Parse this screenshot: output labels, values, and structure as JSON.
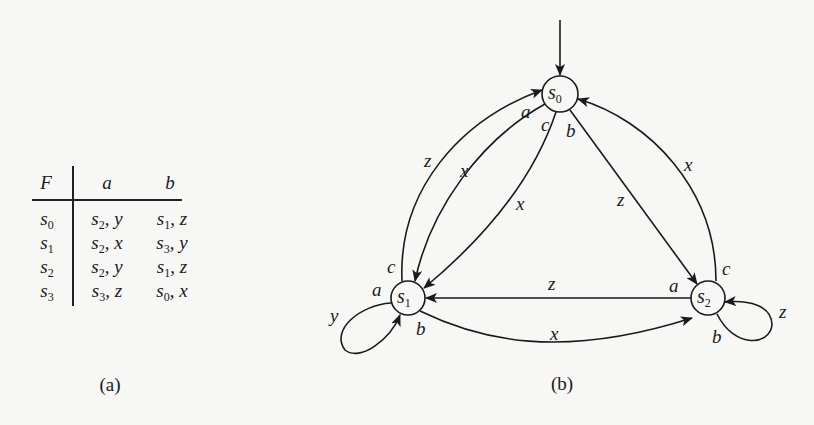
{
  "table": {
    "header": {
      "state": "F",
      "col_a": "a",
      "col_b": "b"
    },
    "rows": [
      {
        "state": "s0",
        "a_next": "s2",
        "a_out": "y",
        "b_next": "s1",
        "b_out": "z"
      },
      {
        "state": "s1",
        "a_next": "s2",
        "a_out": "x",
        "b_next": "s3",
        "b_out": "y"
      },
      {
        "state": "s2",
        "a_next": "s2",
        "a_out": "y",
        "b_next": "s1",
        "b_out": "z"
      },
      {
        "state": "s3",
        "a_next": "s3",
        "a_out": "z",
        "b_next": "s0",
        "b_out": "x"
      }
    ],
    "caption": "(a)"
  },
  "graph": {
    "caption": "(b)",
    "nodes": [
      {
        "id": "s0",
        "label": "s",
        "sub": "0",
        "initial": true
      },
      {
        "id": "s1",
        "label": "s",
        "sub": "1"
      },
      {
        "id": "s2",
        "label": "s",
        "sub": "2"
      }
    ],
    "edges": [
      {
        "from": "s1",
        "to": "s0",
        "input": "c",
        "output": "z"
      },
      {
        "from": "s0",
        "to": "s1",
        "input": "a",
        "output": "x"
      },
      {
        "from": "s0",
        "to": "s1",
        "input": "c",
        "output": "x"
      },
      {
        "from": "s0",
        "to": "s2",
        "input": "b",
        "output": "z"
      },
      {
        "from": "s2",
        "to": "s0",
        "input": "c",
        "output": "x"
      },
      {
        "from": "s2",
        "to": "s1",
        "input": "a",
        "output": "z"
      },
      {
        "from": "s1",
        "to": "s2",
        "input": "b",
        "output": "x"
      },
      {
        "from": "s1",
        "to": "s1",
        "input": "a",
        "output": "y"
      },
      {
        "from": "s2",
        "to": "s2",
        "input": "b",
        "output": "z"
      }
    ],
    "edge_labels": {
      "s1_s0_in": "c",
      "s1_s0_out": "z",
      "s0_s1_a_in": "a",
      "s0_s1_a_out": "x",
      "s0_s1_c_in": "c",
      "s0_s1_c_out": "x",
      "s0_s2_in": "b",
      "s0_s2_out": "z",
      "s2_s0_in": "c",
      "s2_s0_out": "x",
      "s2_s1_in": "a",
      "s2_s1_out": "z",
      "s1_s2_in": "b",
      "s1_s2_out": "x",
      "s1_loop_in": "a",
      "s1_loop_out": "y",
      "s2_loop_in": "b",
      "s2_loop_out": "z"
    }
  }
}
